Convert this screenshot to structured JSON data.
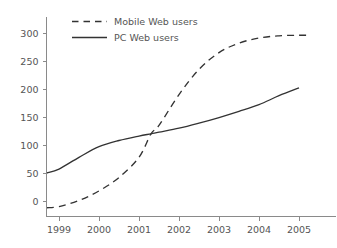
{
  "chart_data": {
    "type": "line",
    "title": "",
    "subtitle": "",
    "xlabel": "",
    "ylabel": "",
    "xlim": [
      1998.6,
      2005.9
    ],
    "ylim": [
      -20,
      310
    ],
    "grid": false,
    "legend_position": "top-left",
    "xticks": [
      1999,
      2000,
      2001,
      2002,
      2003,
      2004,
      2005
    ],
    "xtick_labels": [
      "1999",
      "2000",
      "2001",
      "2002",
      "2003",
      "2004",
      "2005"
    ],
    "yticks": [
      0,
      50,
      100,
      150,
      200,
      250,
      300
    ],
    "ytick_labels": [
      "0",
      "50",
      "100",
      "150",
      "200",
      "250",
      "300"
    ],
    "x": [
      1998.7,
      1999.0,
      1999.5,
      2000.0,
      2000.5,
      2001.0,
      2001.3,
      2001.5,
      2002.0,
      2002.5,
      2003.0,
      2003.5,
      2004.0,
      2004.5,
      2005.0,
      2005.3
    ],
    "series": [
      {
        "name": "Mobile Web users",
        "style": "dashed",
        "color": "#333333",
        "values": [
          -12,
          -10,
          1,
          18,
          42,
          78,
          120,
          135,
          190,
          235,
          265,
          282,
          291,
          295,
          296,
          296
        ]
      },
      {
        "name": "PC Web users",
        "style": "solid",
        "color": "#333333",
        "values": [
          50,
          57,
          78,
          97,
          108,
          116,
          120,
          123,
          130,
          139,
          149,
          160,
          172,
          188,
          202,
          null
        ]
      }
    ],
    "annotations": [],
    "colors": {
      "line": "#333333",
      "text": "#555555",
      "axis": "#8a8a8a",
      "background": "#ffffff"
    }
  },
  "legend": {
    "entries": [
      {
        "label": "Mobile Web users",
        "style": "dashed"
      },
      {
        "label": "PC Web users",
        "style": "solid"
      }
    ]
  },
  "axes": {
    "y_labels": [
      "300",
      "250",
      "200",
      "150",
      "100",
      "50",
      "0"
    ],
    "x_labels": [
      "1999",
      "2000",
      "2001",
      "2002",
      "2003",
      "2004",
      "2005"
    ]
  }
}
